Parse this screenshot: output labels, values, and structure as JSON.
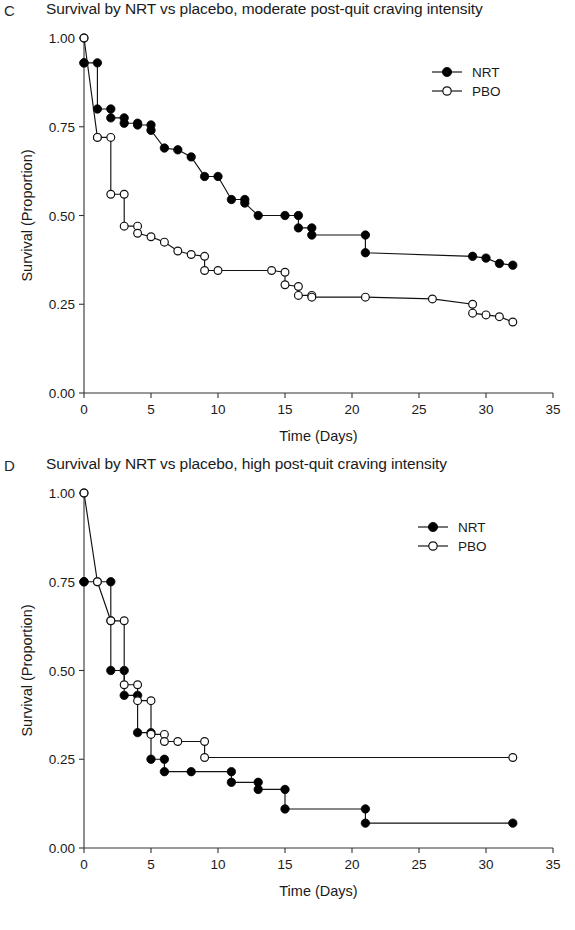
{
  "figure": {
    "panels": [
      {
        "letter": "C",
        "title": "Survival by NRT vs placebo, moderate post-quit craving intensity"
      },
      {
        "letter": "D",
        "title": "Survival by NRT vs placebo, high post-quit craving intensity"
      }
    ]
  },
  "chart_data": [
    {
      "type": "line",
      "panel": "C",
      "title": "Survival by NRT vs placebo, moderate post-quit craving intensity",
      "xlabel": "Time (Days)",
      "ylabel": "Survival (Proportion)",
      "xlim": [
        0,
        35
      ],
      "ylim": [
        0,
        1
      ],
      "xticks": [
        0,
        5,
        10,
        15,
        20,
        25,
        30,
        35
      ],
      "yticks": [
        0.0,
        0.25,
        0.5,
        0.75,
        1.0
      ],
      "ytick_labels": [
        "0.00",
        "0.25",
        "0.50",
        "0.75",
        "1.00"
      ],
      "grid": false,
      "legend_position": "top-right",
      "legend": [
        "NRT",
        "PBO"
      ],
      "series": [
        {
          "name": "NRT",
          "marker": "filled-circle",
          "x": [
            0,
            0,
            1,
            1,
            2,
            2,
            3,
            3,
            4,
            4,
            5,
            5,
            6,
            7,
            8,
            9,
            10,
            11,
            12,
            12,
            13,
            15,
            16,
            16,
            17,
            17,
            21,
            21,
            29,
            30,
            31,
            32
          ],
          "y": [
            0.93,
            0.93,
            0.93,
            0.8,
            0.8,
            0.775,
            0.775,
            0.76,
            0.76,
            0.755,
            0.755,
            0.74,
            0.69,
            0.685,
            0.665,
            0.61,
            0.61,
            0.545,
            0.545,
            0.535,
            0.5,
            0.5,
            0.5,
            0.465,
            0.465,
            0.445,
            0.445,
            0.395,
            0.385,
            0.38,
            0.365,
            0.36
          ]
        },
        {
          "name": "PBO",
          "marker": "open-circle",
          "x": [
            0,
            0,
            1,
            1,
            2,
            2,
            3,
            3,
            4,
            4,
            5,
            6,
            7,
            8,
            9,
            9,
            10,
            14,
            15,
            15,
            16,
            16,
            17,
            17,
            21,
            26,
            29,
            29,
            30,
            31,
            32
          ],
          "y": [
            1.0,
            1.0,
            0.72,
            0.72,
            0.72,
            0.56,
            0.56,
            0.47,
            0.47,
            0.45,
            0.44,
            0.425,
            0.4,
            0.39,
            0.385,
            0.345,
            0.345,
            0.345,
            0.34,
            0.305,
            0.3,
            0.275,
            0.275,
            0.27,
            0.27,
            0.265,
            0.25,
            0.225,
            0.22,
            0.215,
            0.2
          ]
        }
      ]
    },
    {
      "type": "line",
      "panel": "D",
      "title": "Survival by NRT vs placebo, high post-quit craving intensity",
      "xlabel": "Time (Days)",
      "ylabel": "Survival (Proportion)",
      "xlim": [
        0,
        35
      ],
      "ylim": [
        0,
        1
      ],
      "xticks": [
        0,
        5,
        10,
        15,
        20,
        25,
        30,
        35
      ],
      "yticks": [
        0.0,
        0.25,
        0.5,
        0.75,
        1.0
      ],
      "ytick_labels": [
        "0.00",
        "0.25",
        "0.50",
        "0.75",
        "1.00"
      ],
      "grid": false,
      "legend_position": "top-right",
      "legend": [
        "NRT",
        "PBO"
      ],
      "series": [
        {
          "name": "NRT",
          "marker": "filled-circle",
          "x": [
            0,
            0,
            2,
            2,
            3,
            3,
            4,
            4,
            5,
            5,
            6,
            6,
            8,
            11,
            11,
            13,
            13,
            15,
            15,
            21,
            21,
            32
          ],
          "y": [
            0.75,
            0.75,
            0.75,
            0.5,
            0.5,
            0.43,
            0.43,
            0.325,
            0.325,
            0.25,
            0.25,
            0.215,
            0.215,
            0.215,
            0.185,
            0.185,
            0.165,
            0.165,
            0.11,
            0.11,
            0.07,
            0.07
          ]
        },
        {
          "name": "PBO",
          "marker": "open-circle",
          "x": [
            0,
            0,
            1,
            1,
            2,
            2,
            3,
            3,
            4,
            4,
            5,
            5,
            6,
            6,
            7,
            9,
            9,
            32
          ],
          "y": [
            1.0,
            1.0,
            0.75,
            0.75,
            0.64,
            0.64,
            0.64,
            0.46,
            0.46,
            0.415,
            0.415,
            0.32,
            0.32,
            0.3,
            0.3,
            0.3,
            0.255,
            0.255
          ]
        }
      ]
    }
  ]
}
